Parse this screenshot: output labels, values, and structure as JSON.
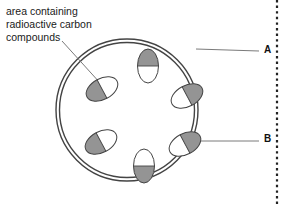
{
  "figure": {
    "type": "biology-cell-diagram",
    "background_color": "#ffffff",
    "caption": "area containing\nradioactive carbon\ncompounds",
    "labels": {
      "a": "A",
      "b": "B"
    },
    "colors": {
      "outline": "#444444",
      "shaded_fill": "#949494",
      "unshaded_fill": "#ffffff",
      "leader_line": "#7a7a7a",
      "text": "#1a1a1a",
      "dotted_edge": "#222222"
    },
    "cell": {
      "shape": "circle",
      "center_x": 127,
      "center_y": 110,
      "outer_radius": 71,
      "inner_radius": 67.5,
      "wall_layers": 2
    },
    "organelles": [
      {
        "name": "chloroplast-top",
        "cx": 148,
        "cy": 66,
        "rx": 10.5,
        "ry": 17,
        "rotation": 0,
        "shaded_half": "top"
      },
      {
        "name": "chloroplast-upper-left",
        "cx": 102,
        "cy": 89,
        "rx": 17,
        "ry": 10.5,
        "rotation": -28,
        "shaded_half": "left"
      },
      {
        "name": "chloroplast-middle-right",
        "cx": 187,
        "cy": 96,
        "rx": 17,
        "ry": 10.5,
        "rotation": -28,
        "shaded_half": "right"
      },
      {
        "name": "chloroplast-lower-left",
        "cx": 101,
        "cy": 142,
        "rx": 17,
        "ry": 10.5,
        "rotation": -28,
        "shaded_half": "left"
      },
      {
        "name": "chloroplast-lower-right",
        "cx": 185,
        "cy": 144,
        "rx": 17,
        "ry": 10.5,
        "rotation": -28,
        "shaded_half": "right"
      },
      {
        "name": "chloroplast-bottom",
        "cx": 144,
        "cy": 166,
        "rx": 10.5,
        "ry": 17,
        "rotation": 0,
        "shaded_half": "bottom"
      }
    ],
    "leaders": [
      {
        "name": "caption-leader",
        "x1": 62,
        "y1": 41,
        "x2": 101,
        "y2": 84
      },
      {
        "name": "leader-a",
        "x1": 196,
        "y1": 49,
        "x2": 259,
        "y2": 51
      },
      {
        "name": "leader-b",
        "x1": 186,
        "y1": 141,
        "x2": 259,
        "y2": 141
      }
    ],
    "right_edge_dotted_line": {
      "x": 277,
      "y_start": 0,
      "y_end": 204
    }
  }
}
